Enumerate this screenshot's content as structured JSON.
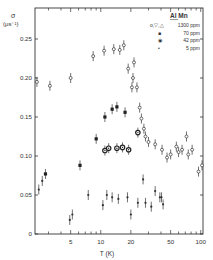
{
  "chart_data": {
    "type": "scatter",
    "title": "",
    "xlabel": "T (K)",
    "ylabel": "σ (μs⁻¹)",
    "xscale": "log",
    "xlim": [
      2.2,
      110
    ],
    "ylim": [
      0,
      0.27
    ],
    "x_ticks": [
      5,
      10,
      20,
      50,
      100
    ],
    "x_tick_labels": [
      "5",
      "10",
      "20",
      "50",
      "100"
    ],
    "y_ticks": [
      0,
      0.05,
      0.1,
      0.15,
      0.2,
      0.25
    ],
    "y_tick_labels": [
      "0",
      "0.05",
      "0.10",
      "0.15",
      "0.20",
      "0.25"
    ],
    "grid": false,
    "legend_position": "upper right",
    "legend_title": "Al Mn",
    "series": [
      {
        "name": "1300 ppm",
        "marker": "o,▽,△ (open)",
        "points": [
          {
            "x": 2.3,
            "y": 0.195
          },
          {
            "x": 3.1,
            "y": 0.19
          },
          {
            "x": 5.0,
            "y": 0.2
          },
          {
            "x": 8.4,
            "y": 0.228
          },
          {
            "x": 10.8,
            "y": 0.235
          },
          {
            "x": 13.5,
            "y": 0.237
          },
          {
            "x": 15.5,
            "y": 0.236
          },
          {
            "x": 17.0,
            "y": 0.242
          },
          {
            "x": 18.8,
            "y": 0.212
          },
          {
            "x": 21.5,
            "y": 0.22
          },
          {
            "x": 21.0,
            "y": 0.2
          },
          {
            "x": 20.5,
            "y": 0.188
          },
          {
            "x": 23.0,
            "y": 0.188
          },
          {
            "x": 24.5,
            "y": 0.162
          },
          {
            "x": 25.5,
            "y": 0.148
          },
          {
            "x": 27.0,
            "y": 0.135
          },
          {
            "x": 28.0,
            "y": 0.125
          },
          {
            "x": 30.0,
            "y": 0.118
          },
          {
            "x": 35.0,
            "y": 0.115
          },
          {
            "x": 41.0,
            "y": 0.108
          },
          {
            "x": 46.0,
            "y": 0.098
          },
          {
            "x": 50.0,
            "y": 0.102
          },
          {
            "x": 57.0,
            "y": 0.112
          },
          {
            "x": 60.0,
            "y": 0.105
          },
          {
            "x": 65.0,
            "y": 0.108
          },
          {
            "x": 72.0,
            "y": 0.125
          },
          {
            "x": 75.0,
            "y": 0.102
          },
          {
            "x": 82.0,
            "y": 0.108
          },
          {
            "x": 95.0,
            "y": 0.08
          },
          {
            "x": 103.0,
            "y": 0.088
          }
        ]
      },
      {
        "name": "70 ppm",
        "marker": "● (filled)",
        "points": [
          {
            "x": 2.8,
            "y": 0.077
          },
          {
            "x": 6.2,
            "y": 0.088
          },
          {
            "x": 9.0,
            "y": 0.122
          },
          {
            "x": 11.0,
            "y": 0.15
          },
          {
            "x": 13.0,
            "y": 0.16
          },
          {
            "x": 14.5,
            "y": 0.163
          },
          {
            "x": 17.5,
            "y": 0.156
          }
        ]
      },
      {
        "name": "42 ppm",
        "marker": "◉ (bull's-eye)",
        "points": [
          {
            "x": 11.0,
            "y": 0.107
          },
          {
            "x": 12.0,
            "y": 0.11
          },
          {
            "x": 14.5,
            "y": 0.11
          },
          {
            "x": 16.5,
            "y": 0.111
          },
          {
            "x": 19.0,
            "y": 0.108
          },
          {
            "x": 23.5,
            "y": 0.13
          }
        ]
      },
      {
        "name": "5 ppm",
        "marker": "• (small dot)",
        "points": [
          {
            "x": 2.4,
            "y": 0.057
          },
          {
            "x": 2.6,
            "y": 0.068
          },
          {
            "x": 4.9,
            "y": 0.018
          },
          {
            "x": 5.2,
            "y": 0.025
          },
          {
            "x": 7.5,
            "y": 0.05
          },
          {
            "x": 10.5,
            "y": 0.037
          },
          {
            "x": 11.5,
            "y": 0.05
          },
          {
            "x": 13.0,
            "y": 0.047
          },
          {
            "x": 15.0,
            "y": 0.045
          },
          {
            "x": 18.5,
            "y": 0.047
          },
          {
            "x": 20.0,
            "y": 0.025
          },
          {
            "x": 23.5,
            "y": 0.04
          },
          {
            "x": 26.5,
            "y": 0.07
          },
          {
            "x": 28.0,
            "y": 0.04
          },
          {
            "x": 32.0,
            "y": 0.035
          },
          {
            "x": 35.0,
            "y": 0.055
          },
          {
            "x": 39.0,
            "y": 0.047
          },
          {
            "x": 40.5,
            "y": 0.047
          },
          {
            "x": 42.0,
            "y": 0.038
          }
        ]
      }
    ]
  },
  "legend": {
    "title": "Al Mn",
    "entries": [
      {
        "symbol": "o,▽,△",
        "label": "1300 ppm"
      },
      {
        "symbol": "■",
        "label": "70 ppm"
      },
      {
        "symbol": "◉",
        "label": "42 ppm"
      },
      {
        "symbol": "•",
        "label": "5 ppm"
      }
    ]
  },
  "axes": {
    "y_label_line1": "σ",
    "y_label_line2": "(μs⁻¹)",
    "x_label": "T (K)"
  }
}
